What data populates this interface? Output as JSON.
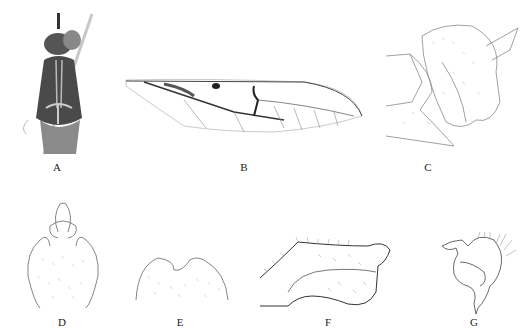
{
  "figure": {
    "panels": [
      {
        "id": "A",
        "label": "A",
        "content": "habitus, dorsal view (photograph)"
      },
      {
        "id": "B",
        "label": "B",
        "content": "wing"
      },
      {
        "id": "C",
        "label": "C",
        "content": "terminalia, lateral view"
      },
      {
        "id": "D",
        "label": "D",
        "content": "terminalia, ventral view"
      },
      {
        "id": "E",
        "label": "E",
        "content": "sternite"
      },
      {
        "id": "F",
        "label": "F",
        "content": "gonostylus"
      },
      {
        "id": "G",
        "label": "G",
        "content": "gonostylus detail"
      }
    ]
  }
}
